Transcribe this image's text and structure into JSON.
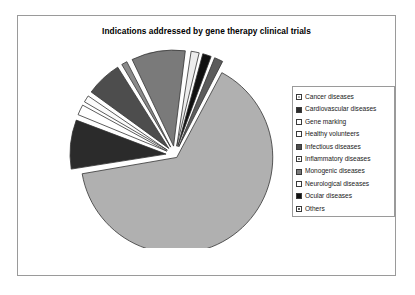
{
  "chart_title": "Indications addressed by gene therapy clinical trials",
  "legend": {
    "items": [
      {
        "label": "Cancer diseases",
        "swatch": "light-gray-hatch",
        "color": "#b0b0b0"
      },
      {
        "label": "Cardiovascular diseases",
        "swatch": "dark-solid",
        "color": "#2b2b2b"
      },
      {
        "label": "Gene marking",
        "swatch": "white-solid",
        "color": "#ffffff"
      },
      {
        "label": "Healthy volunteers",
        "swatch": "white-solid",
        "color": "#fbfbfb"
      },
      {
        "label": "Infectious diseases",
        "swatch": "dark-solid",
        "color": "#4d4d4d"
      },
      {
        "label": "Inflammatory diseases",
        "swatch": "mid-gray-hatch",
        "color": "#8a8a8a"
      },
      {
        "label": "Monogenic diseases",
        "swatch": "dark-solid",
        "color": "#7a7a7a"
      },
      {
        "label": "Neurological diseases",
        "swatch": "white-solid",
        "color": "#ededed"
      },
      {
        "label": "Ocular diseases",
        "swatch": "black-solid",
        "color": "#111111"
      },
      {
        "label": "Others",
        "swatch": "mid-gray-hatch",
        "color": "#5c5c5c"
      }
    ]
  },
  "chart_data": {
    "type": "pie",
    "title": "Indications addressed by gene therapy clinical trials",
    "exploded": true,
    "legend_position": "right",
    "grid": false,
    "unit": "percent",
    "categories": [
      "Cancer diseases",
      "Cardiovascular diseases",
      "Gene marking",
      "Healthy volunteers",
      "Infectious diseases",
      "Inflammatory diseases",
      "Monogenic diseases",
      "Neurological diseases",
      "Ocular diseases",
      "Others"
    ],
    "values": [
      64.5,
      8.7,
      2.2,
      1.6,
      6.5,
      1.4,
      9.5,
      1.8,
      1.9,
      1.9
    ],
    "colors": [
      "#b0b0b0",
      "#2b2b2b",
      "#ffffff",
      "#fbfbfb",
      "#4d4d4d",
      "#8a8a8a",
      "#7a7a7a",
      "#ededed",
      "#111111",
      "#5c5c5c"
    ]
  }
}
